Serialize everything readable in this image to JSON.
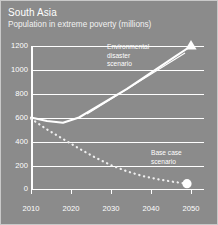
{
  "header": {
    "title": "South Asia",
    "subtitle": "Population in extreme poverty (millions)"
  },
  "annotations": {
    "environmental": {
      "line1": "Environmental",
      "line2": "disaster",
      "line3": "scenario"
    },
    "base": {
      "line1": "Base case",
      "line2": "scenario"
    }
  },
  "colors": {
    "background": "#8b8b8b",
    "ink": "#ffffff",
    "border": "#c9c9c9"
  },
  "chart_data": {
    "type": "line",
    "title": "South Asia",
    "subtitle": "Population in extreme poverty (millions)",
    "xlabel": "",
    "ylabel": "Population in extreme poverty (millions)",
    "xlim": [
      2010,
      2050
    ],
    "ylim": [
      0,
      1200
    ],
    "yticks": [
      0,
      200,
      400,
      600,
      800,
      1000,
      1200
    ],
    "xticks": [
      2010,
      2020,
      2030,
      2040,
      2050
    ],
    "grid": "horizontal",
    "legend": "annotations",
    "series": [
      {
        "name": "Environmental disaster scenario",
        "style": "solid",
        "marker": "triangle",
        "marker_at": [
          2050,
          1200
        ],
        "x": [
          2010,
          2014,
          2018,
          2022,
          2026,
          2030,
          2034,
          2038,
          2042,
          2046,
          2050
        ],
        "values": [
          600,
          570,
          556,
          600,
          680,
          760,
          840,
          930,
          1020,
          1110,
          1200
        ]
      },
      {
        "name": "Base case scenario",
        "style": "dotted",
        "marker": "circle",
        "marker_at": [
          2049,
          45
        ],
        "x": [
          2010,
          2014,
          2018,
          2022,
          2026,
          2030,
          2034,
          2038,
          2042,
          2046,
          2049
        ],
        "values": [
          590,
          500,
          420,
          340,
          265,
          200,
          148,
          108,
          80,
          58,
          45
        ]
      }
    ]
  }
}
